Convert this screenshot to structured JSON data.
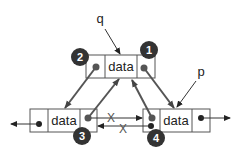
{
  "diagram": {
    "title": "",
    "type": "doubly-linked-list-insertion",
    "nodes": {
      "top": {
        "label": "data"
      },
      "left": {
        "label": "data"
      },
      "right": {
        "label": "data"
      }
    },
    "pointers": {
      "q": "q",
      "p": "p"
    },
    "steps": [
      "1",
      "2",
      "3",
      "4"
    ],
    "removed_links": [
      "X",
      "X"
    ],
    "colors": {
      "line": "#555555",
      "badge": "#333333",
      "badge_text": "#ffffff",
      "box_border": "#555555"
    }
  }
}
